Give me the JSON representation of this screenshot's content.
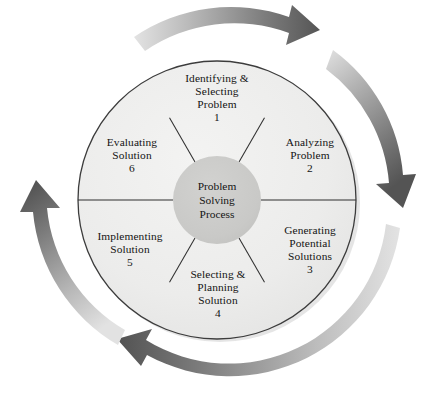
{
  "diagram": {
    "title": "Problem Solving Process",
    "type": "cyclical-process-wheel",
    "hub": {
      "name": "problem-solving-process-hub",
      "lines": [
        "Problem",
        "Solving",
        "Process"
      ]
    },
    "segments": [
      {
        "id": "identifying-selecting-problem",
        "number": "1",
        "lines": [
          "Identifying &",
          "Selecting",
          "Problem"
        ]
      },
      {
        "id": "analyzing-problem",
        "number": "2",
        "lines": [
          "Analyzing",
          "Problem"
        ]
      },
      {
        "id": "generating-potential-solutions",
        "number": "3",
        "lines": [
          "Generating",
          "Potential",
          "Solutions"
        ]
      },
      {
        "id": "selecting-planning-solution",
        "number": "4",
        "lines": [
          "Selecting &",
          "Planning",
          "Solution"
        ]
      },
      {
        "id": "implementing-solution",
        "number": "5",
        "lines": [
          "Implementing",
          "Solution"
        ]
      },
      {
        "id": "evaluating-solution",
        "number": "6",
        "lines": [
          "Evaluating",
          "Solution"
        ]
      }
    ],
    "arrows": [
      {
        "id": "arrow-top",
        "direction": "clockwise",
        "from": "upper-left",
        "to": "upper-right"
      },
      {
        "id": "arrow-right",
        "direction": "clockwise",
        "from": "upper-right",
        "to": "lower-right"
      },
      {
        "id": "arrow-bottom",
        "direction": "clockwise",
        "from": "lower-right",
        "to": "lower-left"
      },
      {
        "id": "arrow-left",
        "direction": "clockwise",
        "from": "lower-left",
        "to": "upper-left"
      }
    ],
    "colors": {
      "background": "#ffffff",
      "segment_fill": "#ededec",
      "segment_fill_alt": "#e8e8e7",
      "hub_fill": "#c9c9c7",
      "outline": "#3c3c3c",
      "arrow_light": "#dcdcdc",
      "arrow_dark": "#555555",
      "text": "#141414"
    }
  }
}
